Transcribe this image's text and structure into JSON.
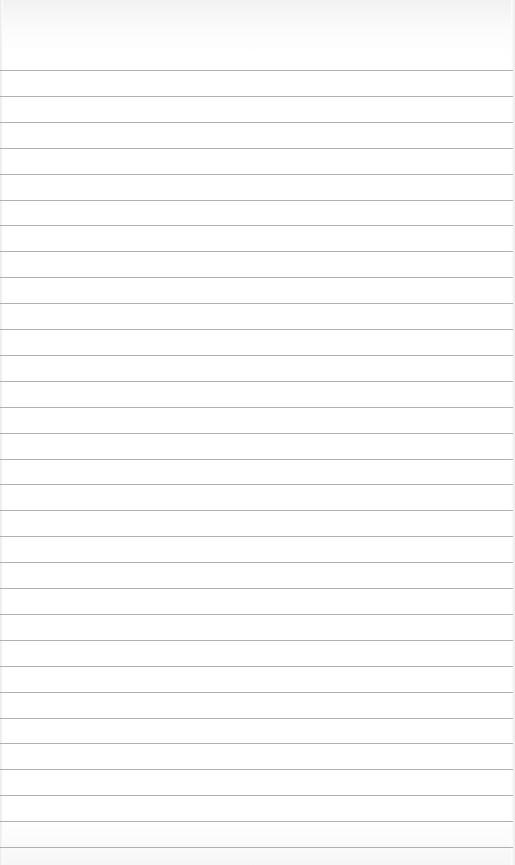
{
  "page": {
    "type": "lined-paper",
    "background_color": "#ffffff",
    "line_color": "#a3a3a3",
    "line_count": 31,
    "first_line_y": 70,
    "line_spacing": 25.9,
    "text_lines": []
  }
}
